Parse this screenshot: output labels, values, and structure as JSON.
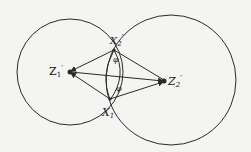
{
  "diagram": {
    "labels": {
      "z1": "Z",
      "z1_sub": "1",
      "z1_prime": "′",
      "z2": "Z",
      "z2_sub": "2",
      "z2_prime": "′",
      "x1": "X",
      "x1_sub": "1",
      "x2": "X",
      "x2_sub": "2",
      "x2_prime": "′",
      "angle_top": "φ",
      "angle_bottom": "φ"
    },
    "colors": {
      "stroke": "#2a2a2a",
      "background": "#f4f4f2"
    }
  }
}
